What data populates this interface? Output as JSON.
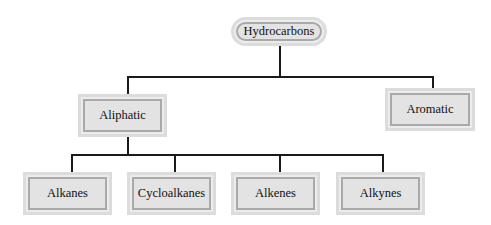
{
  "diagram": {
    "root": {
      "label": "Hydrocarbons"
    },
    "level1": [
      {
        "label": "Aliphatic"
      },
      {
        "label": "Aromatic"
      }
    ],
    "level2": [
      {
        "label": "Alkanes"
      },
      {
        "label": "Cycloalkanes"
      },
      {
        "label": "Alkenes"
      },
      {
        "label": "Alkynes"
      }
    ],
    "edges": [
      [
        "Hydrocarbons",
        "Aliphatic"
      ],
      [
        "Hydrocarbons",
        "Aromatic"
      ],
      [
        "Aliphatic",
        "Alkanes"
      ],
      [
        "Aliphatic",
        "Cycloalkanes"
      ],
      [
        "Aliphatic",
        "Alkenes"
      ],
      [
        "Aliphatic",
        "Alkynes"
      ]
    ],
    "colors": {
      "line": "#1a1a1a",
      "box_fill": "#e3e3e3",
      "box_border": "#a9a9a9",
      "box_outer": "#dcdcdc"
    }
  }
}
